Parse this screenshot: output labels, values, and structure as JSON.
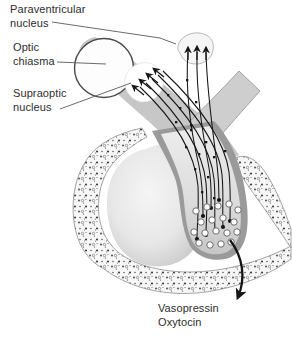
{
  "figure": {
    "kind": "anatomical-diagram",
    "labels": {
      "paraventricular_line1": "Paraventricular",
      "paraventricular_line2": "nucleus",
      "optic_line1": "Optic",
      "optic_line2": "chiasma",
      "supraoptic_line1": "Supraoptic",
      "supraoptic_line2": "nucleus",
      "hormone_line1": "Vasopressin",
      "hormone_line2": "Oxytocin"
    },
    "colors": {
      "background": "#ffffff",
      "band_gray": "#c7c7c7",
      "stalk_dark_gray": "#9a9a9a",
      "lobe_inner_gray": "#c9c9c9",
      "anterior_lobe_light": "#e9e9e9",
      "bone_base": "#f7f7f7",
      "bone_speckle": "#3f3f3f",
      "axon_line": "#151515",
      "leader_line": "#5a5a5a",
      "text": "#2e2e2e"
    }
  }
}
